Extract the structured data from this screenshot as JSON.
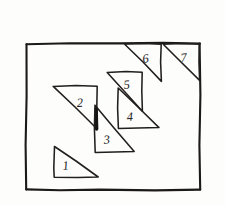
{
  "figure": {
    "background_color": "#fdfdfc",
    "ink_color": "#1c1a18",
    "style": "hand-drawn pencil sketch",
    "frame": {
      "name": "outer-rectangle",
      "x": 26,
      "y": 43,
      "width": 174,
      "height": 147
    },
    "triangles": [
      {
        "label": "1",
        "name": "triangle-1",
        "right_angle_at": "bottom-left",
        "points": "54,146 54,177 98,177",
        "label_x": 63,
        "label_y": 170
      },
      {
        "label": "2",
        "name": "triangle-2",
        "right_angle_at": "top-right",
        "points": "53,86 97,86 97,129",
        "label_x": 77,
        "label_y": 107
      },
      {
        "label": "3",
        "name": "triangle-3",
        "right_angle_at": "bottom-left",
        "points": "95,105 95,152 134,152",
        "label_x": 104,
        "label_y": 144
      },
      {
        "label": "4",
        "name": "triangle-4",
        "right_angle_at": "bottom-left",
        "points": "118,88 118,128 159,128",
        "label_x": 127,
        "label_y": 121
      },
      {
        "label": "5",
        "name": "triangle-5",
        "right_angle_at": "top-right",
        "points": "107,72 142,72 142,111",
        "label_x": 124,
        "label_y": 89
      },
      {
        "label": "6",
        "name": "triangle-6",
        "right_angle_at": "top-right",
        "points": "124,44 161,44 161,81",
        "label_x": 143,
        "label_y": 63
      },
      {
        "label": "7",
        "name": "triangle-7",
        "right_angle_at": "top-right",
        "points": "163,44 199,44 199,80",
        "label_x": 181,
        "label_y": 62
      }
    ],
    "overlap_mark": {
      "name": "overlap-shading",
      "description": "dark thickened stroke where triangle 2 right edge meets triangle 3 left edge",
      "x1": 96,
      "y1": 108,
      "x2": 96,
      "y2": 129
    }
  }
}
